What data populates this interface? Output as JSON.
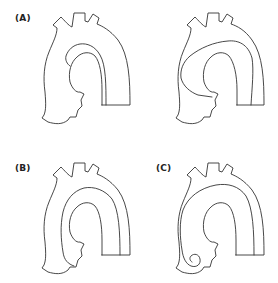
{
  "figure": {
    "panels": [
      {
        "id": "A",
        "label": "(A)",
        "description": "Aortic arch with dissection flap, two variants (left and right)"
      },
      {
        "id": "B",
        "label": "(B)",
        "description": "Aortic arch with intimal flap following arch curvature"
      },
      {
        "id": "C",
        "label": "(C)",
        "description": "Aortic arch with flap extending into ascending aorta with coiled end"
      }
    ],
    "colors": {
      "background": "#ffffff",
      "stroke": "#333333",
      "text": "#222222"
    }
  }
}
